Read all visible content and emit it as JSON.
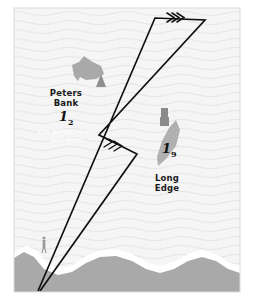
{
  "figure": {
    "name": "nautical-chart-sketch",
    "frame": {
      "x": 14,
      "y": 8,
      "width": 226,
      "height": 284
    }
  },
  "colors": {
    "water": "#f4f4f4",
    "wave_line": "#e4e4e4",
    "land": "#a9a9a9",
    "shoal": "#a9a9a9",
    "surf_white": "#ffffff",
    "track_line": "#111111",
    "label_text": "#1a1a1a",
    "faint_text": "#fbfbfb",
    "page_background": "#ffffff"
  },
  "labels": [
    {
      "id": "peters-bank",
      "line1": "Peters",
      "line2": "Bank",
      "x": 48,
      "y": 88
    },
    {
      "id": "long-edge",
      "line1": "Long",
      "line2": "Edge",
      "x": 148,
      "y": 173
    }
  ],
  "depth_marks": [
    {
      "id": "depth-peters-bank",
      "value": "1",
      "subscript": "2",
      "x": 59,
      "y": 110
    },
    {
      "id": "depth-long-edge",
      "value": "1",
      "subscript": "9",
      "x": 162,
      "y": 142
    }
  ],
  "faint_note": {
    "id": "faint-annotation",
    "line1": "the point where",
    "line2": "surf lines",
    "x": 36,
    "y": 129
  },
  "markers": [
    {
      "id": "triangle-beacon",
      "type": "triangle",
      "x": 101,
      "y": 83,
      "size": 9
    },
    {
      "id": "post-beacon",
      "type": "post",
      "x": 164,
      "y": 112,
      "w": 7,
      "h": 14
    },
    {
      "id": "person-figure",
      "type": "person",
      "x": 44,
      "y": 239
    }
  ],
  "shoals": [
    {
      "id": "peters-bank-shoal",
      "x": 70,
      "y": 56
    },
    {
      "id": "long-edge-shoal",
      "x": 156,
      "y": 120
    }
  ],
  "track": {
    "id": "vessel-track",
    "arrow_style": "triple-chevron",
    "vertices": [
      {
        "x": 38,
        "y": 291
      },
      {
        "x": 155,
        "y": 18
      },
      {
        "x": 205,
        "y": 20
      },
      {
        "x": 99,
        "y": 135
      },
      {
        "x": 137,
        "y": 154
      },
      {
        "x": 40,
        "y": 291
      }
    ],
    "arrowheads": [
      {
        "id": "arrowhead-top",
        "x": 176,
        "y": 17,
        "angle": 0
      },
      {
        "id": "arrowhead-middle",
        "x": 113,
        "y": 143,
        "angle": 22
      }
    ]
  }
}
